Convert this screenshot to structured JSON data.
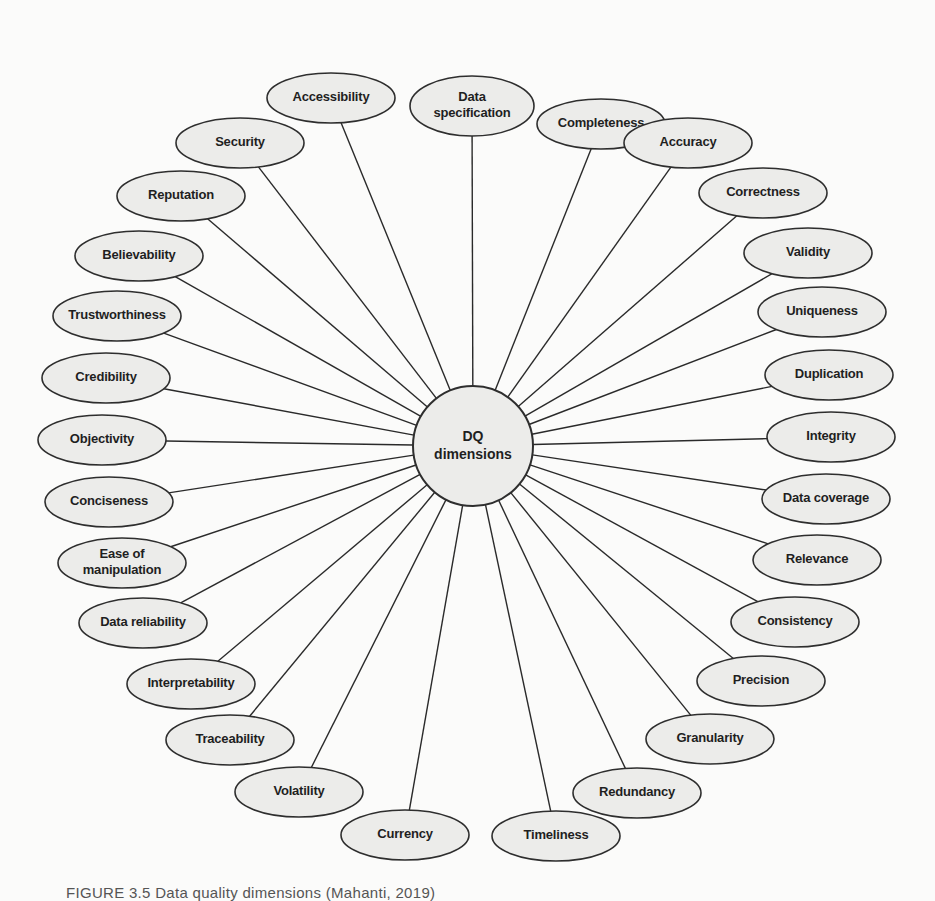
{
  "diagram": {
    "type": "hub-and-spoke",
    "hub": {
      "label_lines": [
        "DQ",
        "dimensions"
      ],
      "cx": 473,
      "cy": 446,
      "r": 60
    },
    "nodes": [
      {
        "label_lines": [
          "Data",
          "specification"
        ],
        "cx": 472,
        "cy": 106,
        "rx": 62,
        "ry": 30
      },
      {
        "label_lines": [
          "Completeness"
        ],
        "cx": 601,
        "cy": 124,
        "rx": 64,
        "ry": 25
      },
      {
        "label_lines": [
          "Accuracy"
        ],
        "cx": 688,
        "cy": 143,
        "rx": 64,
        "ry": 25
      },
      {
        "label_lines": [
          "Correctness"
        ],
        "cx": 763,
        "cy": 193,
        "rx": 64,
        "ry": 25
      },
      {
        "label_lines": [
          "Validity"
        ],
        "cx": 808,
        "cy": 253,
        "rx": 64,
        "ry": 25
      },
      {
        "label_lines": [
          "Uniqueness"
        ],
        "cx": 822,
        "cy": 312,
        "rx": 64,
        "ry": 25
      },
      {
        "label_lines": [
          "Duplication"
        ],
        "cx": 829,
        "cy": 375,
        "rx": 64,
        "ry": 25
      },
      {
        "label_lines": [
          "Integrity"
        ],
        "cx": 831,
        "cy": 437,
        "rx": 64,
        "ry": 25
      },
      {
        "label_lines": [
          "Data coverage"
        ],
        "cx": 826,
        "cy": 499,
        "rx": 64,
        "ry": 25
      },
      {
        "label_lines": [
          "Relevance"
        ],
        "cx": 817,
        "cy": 560,
        "rx": 64,
        "ry": 25
      },
      {
        "label_lines": [
          "Consistency"
        ],
        "cx": 795,
        "cy": 622,
        "rx": 64,
        "ry": 25
      },
      {
        "label_lines": [
          "Precision"
        ],
        "cx": 761,
        "cy": 681,
        "rx": 64,
        "ry": 25
      },
      {
        "label_lines": [
          "Granularity"
        ],
        "cx": 710,
        "cy": 739,
        "rx": 64,
        "ry": 25
      },
      {
        "label_lines": [
          "Redundancy"
        ],
        "cx": 637,
        "cy": 793,
        "rx": 64,
        "ry": 25
      },
      {
        "label_lines": [
          "Timeliness"
        ],
        "cx": 556,
        "cy": 836,
        "rx": 64,
        "ry": 25
      },
      {
        "label_lines": [
          "Currency"
        ],
        "cx": 405,
        "cy": 835,
        "rx": 64,
        "ry": 25
      },
      {
        "label_lines": [
          "Volatility"
        ],
        "cx": 299,
        "cy": 792,
        "rx": 64,
        "ry": 25
      },
      {
        "label_lines": [
          "Traceability"
        ],
        "cx": 230,
        "cy": 740,
        "rx": 64,
        "ry": 25
      },
      {
        "label_lines": [
          "Interpretability"
        ],
        "cx": 191,
        "cy": 684,
        "rx": 64,
        "ry": 25
      },
      {
        "label_lines": [
          "Data reliability"
        ],
        "cx": 143,
        "cy": 623,
        "rx": 64,
        "ry": 25
      },
      {
        "label_lines": [
          "Ease of",
          "manipulation"
        ],
        "cx": 122,
        "cy": 563,
        "rx": 64,
        "ry": 25
      },
      {
        "label_lines": [
          "Conciseness"
        ],
        "cx": 109,
        "cy": 502,
        "rx": 64,
        "ry": 25
      },
      {
        "label_lines": [
          "Objectivity"
        ],
        "cx": 102,
        "cy": 440,
        "rx": 64,
        "ry": 25
      },
      {
        "label_lines": [
          "Credibility"
        ],
        "cx": 106,
        "cy": 378,
        "rx": 64,
        "ry": 25
      },
      {
        "label_lines": [
          "Trustworthiness"
        ],
        "cx": 117,
        "cy": 316,
        "rx": 64,
        "ry": 25
      },
      {
        "label_lines": [
          "Believability"
        ],
        "cx": 139,
        "cy": 256,
        "rx": 64,
        "ry": 25
      },
      {
        "label_lines": [
          "Reputation"
        ],
        "cx": 181,
        "cy": 196,
        "rx": 64,
        "ry": 25
      },
      {
        "label_lines": [
          "Security"
        ],
        "cx": 240,
        "cy": 143,
        "rx": 64,
        "ry": 25
      },
      {
        "label_lines": [
          "Accessibility"
        ],
        "cx": 331,
        "cy": 98,
        "rx": 64,
        "ry": 25
      }
    ]
  },
  "caption": "FIGURE 3.5 Data quality dimensions (Mahanti, 2019)"
}
